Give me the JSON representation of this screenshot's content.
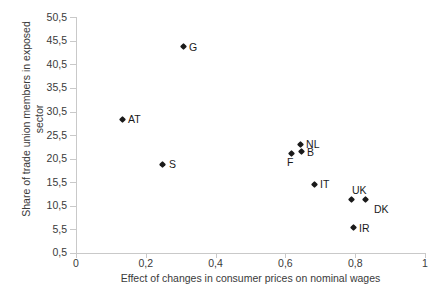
{
  "chart_data": {
    "type": "scatter",
    "title": "",
    "xlabel": "Effect of changes in consumer prices on nominal wages",
    "ylabel": "Share of trade union members in exposed sector",
    "xlim": [
      0,
      1
    ],
    "ylim": [
      0.5,
      50.5
    ],
    "grid": false,
    "legend": "none",
    "x_ticks": [
      "0",
      "0,2",
      "0,4",
      "0,6",
      "0,8",
      "1"
    ],
    "x_tick_values": [
      0,
      0.2,
      0.4,
      0.6,
      0.8,
      1
    ],
    "y_ticks": [
      "0,5",
      "5,5",
      "10,5",
      "15,5",
      "20,5",
      "25,5",
      "30,5",
      "35,5",
      "40,5",
      "45,5",
      "50,5"
    ],
    "y_tick_values": [
      0.5,
      5.5,
      10.5,
      15.5,
      20.5,
      25.5,
      30.5,
      35.5,
      40.5,
      45.5,
      50.5
    ],
    "marker_color": "#1a1a1a",
    "marker_shape": "diamond",
    "points": [
      {
        "label": "AT",
        "x": 0.132,
        "y": 28.9,
        "label_pos": "right"
      },
      {
        "label": "G",
        "x": 0.307,
        "y": 44.3,
        "label_pos": "right"
      },
      {
        "label": "S",
        "x": 0.249,
        "y": 19.3,
        "label_pos": "right"
      },
      {
        "label": "F",
        "x": 0.616,
        "y": 21.6,
        "label_pos": "below"
      },
      {
        "label": "B",
        "x": 0.645,
        "y": 21.9,
        "label_pos": "right"
      },
      {
        "label": "NL",
        "x": 0.642,
        "y": 23.5,
        "label_pos": "right"
      },
      {
        "label": "IT",
        "x": 0.682,
        "y": 15.0,
        "label_pos": "right"
      },
      {
        "label": "UK",
        "x": 0.788,
        "y": 11.8,
        "label_pos": "above"
      },
      {
        "label": "DK",
        "x": 0.828,
        "y": 11.8,
        "label_pos": "below-right"
      },
      {
        "label": "IR",
        "x": 0.794,
        "y": 5.8,
        "label_pos": "right"
      }
    ]
  }
}
